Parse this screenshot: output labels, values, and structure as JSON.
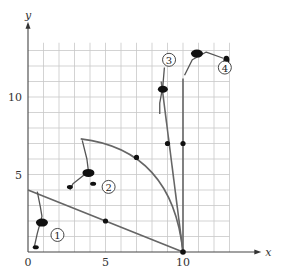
{
  "diagram": {
    "axes": {
      "x_label": "x",
      "y_label": "y",
      "x_ticks": [
        {
          "value": 0,
          "label": "0"
        },
        {
          "value": 5,
          "label": "5"
        },
        {
          "value": 10,
          "label": "10"
        }
      ],
      "y_ticks": [
        {
          "value": 5,
          "label": "5"
        },
        {
          "value": 10,
          "label": "10"
        }
      ],
      "grid": true,
      "x_range": [
        0,
        13
      ],
      "y_range": [
        0,
        13.5
      ]
    },
    "pivot": {
      "x": 10,
      "y": 0
    },
    "poles": [
      {
        "id": 1,
        "label": "1",
        "shape": "straight",
        "top": [
          0,
          4
        ],
        "marked_point": [
          5,
          2
        ],
        "label_pos": [
          1.9,
          1.1
        ]
      },
      {
        "id": 2,
        "label": "2",
        "shape": "curved",
        "top": [
          3.4,
          7.3
        ],
        "marked_point": [
          7,
          6.1
        ],
        "label_pos": [
          5.2,
          4.2
        ]
      },
      {
        "id": 3,
        "label": "3",
        "shape": "straight",
        "top": [
          8.6,
          11
        ],
        "marked_point": [
          9,
          7
        ],
        "label_pos": [
          9.1,
          12.4
        ]
      },
      {
        "id": 4,
        "label": "4",
        "shape": "straight",
        "top": [
          10,
          11.2
        ],
        "marked_point": [
          10,
          7
        ],
        "label_pos": [
          12.7,
          11.9
        ]
      }
    ]
  }
}
